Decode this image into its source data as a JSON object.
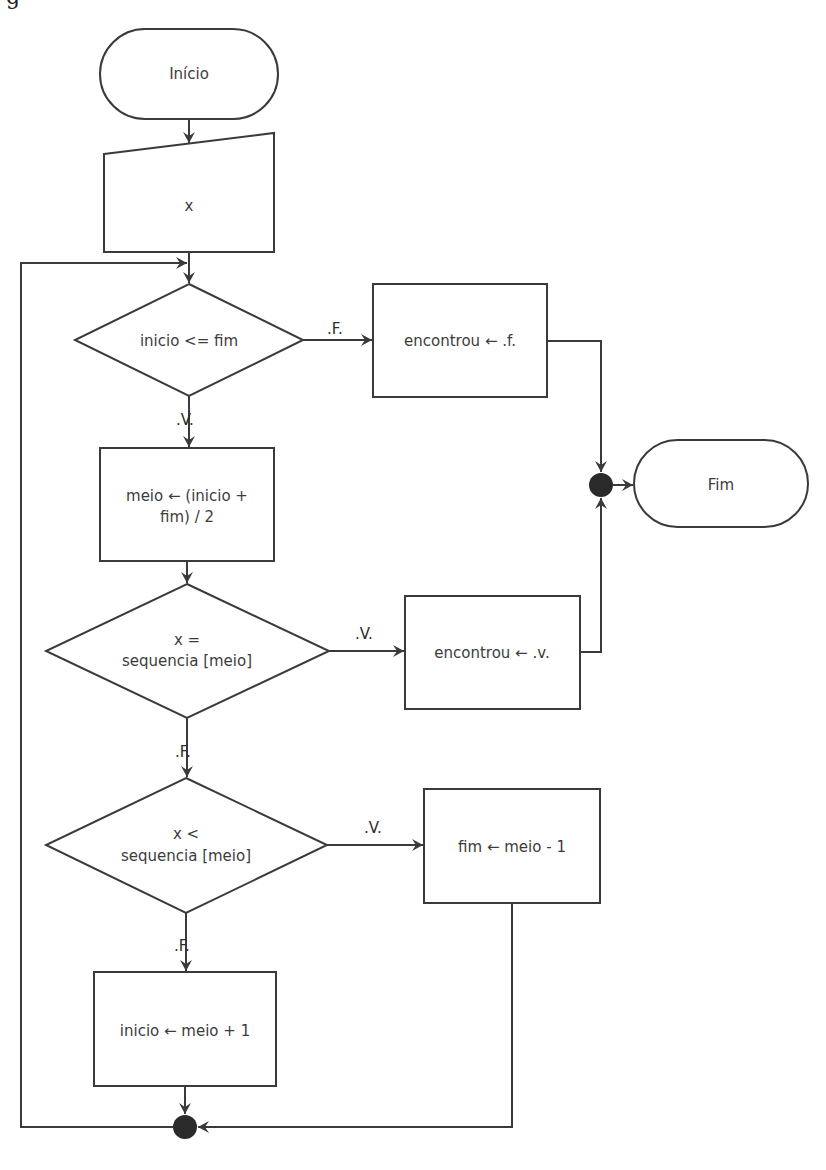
{
  "diagram": {
    "type": "flowchart",
    "topic": "binary search",
    "clipped_heading": "g",
    "nodes": {
      "start": {
        "kind": "terminal",
        "label": "Início"
      },
      "input": {
        "kind": "manual-input",
        "label": "x"
      },
      "cond_loop": {
        "kind": "decision",
        "label": "inicio <= fim"
      },
      "set_false": {
        "kind": "process",
        "label": "encontrou  ← .f."
      },
      "mid": {
        "kind": "process",
        "line1": "meio  ← (inicio +",
        "line2": "fim) / 2"
      },
      "cond_equal": {
        "kind": "decision",
        "line1": "x =",
        "line2": "sequencia   [meio]"
      },
      "set_true": {
        "kind": "process",
        "label": "encontrou  ← .v."
      },
      "end": {
        "kind": "terminal",
        "label": "Fim"
      },
      "cond_less": {
        "kind": "decision",
        "line1": "x <",
        "line2": "sequencia   [meio]"
      },
      "dec_end": {
        "kind": "process",
        "label": "fim ← meio - 1"
      },
      "inc_start": {
        "kind": "process",
        "label": "inicio  ← meio + 1"
      }
    },
    "edges": {
      "loop_false": ".F.",
      "loop_true": ".V.",
      "equal_true": ".V.",
      "equal_false": ".F.",
      "less_true": ".V.",
      "less_false": ".F."
    },
    "colors": {
      "stroke": "#3a3a3a",
      "text": "#3c3c3c",
      "junction": "#2a2a2a",
      "background": "#ffffff"
    }
  }
}
